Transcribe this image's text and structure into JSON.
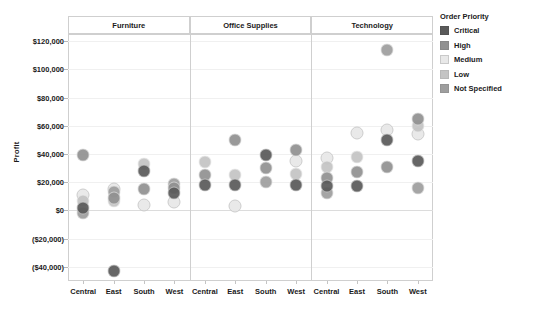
{
  "chart_data": {
    "type": "scatter",
    "title": "",
    "xlabel": "",
    "ylabel": "Profit",
    "ylim": [
      -50000,
      125000
    ],
    "grid": true,
    "legend_position": "right",
    "legend_title": "Order Priority",
    "panels": [
      "Furniture",
      "Office Supplies",
      "Technology"
    ],
    "regions": [
      "Central",
      "East",
      "South",
      "West"
    ],
    "y_ticks": [
      {
        "value": 120000,
        "label": "$120,000"
      },
      {
        "value": 100000,
        "label": "$100,000"
      },
      {
        "value": 80000,
        "label": "$80,000"
      },
      {
        "value": 60000,
        "label": "$60,000"
      },
      {
        "value": 40000,
        "label": "$40,000"
      },
      {
        "value": 20000,
        "label": "$20,000"
      },
      {
        "value": 0,
        "label": "$0"
      },
      {
        "value": -20000,
        "label": "($20,000)"
      },
      {
        "value": -40000,
        "label": "($40,000)"
      }
    ],
    "series": [
      {
        "name": "Critical",
        "color": "#5a5a5a"
      },
      {
        "name": "High",
        "color": "#919191"
      },
      {
        "name": "Medium",
        "color": "#e8e8e8"
      },
      {
        "name": "Low",
        "color": "#c4c4c4"
      },
      {
        "name": "Not Specified",
        "color": "#9e9e9e"
      }
    ],
    "points": [
      {
        "panel": "Furniture",
        "region": "Central",
        "priority": "High",
        "profit": 39000
      },
      {
        "panel": "Furniture",
        "region": "Central",
        "priority": "Medium",
        "profit": 11000
      },
      {
        "panel": "Furniture",
        "region": "Central",
        "priority": "Low",
        "profit": 7000
      },
      {
        "panel": "Furniture",
        "region": "Central",
        "priority": "Critical",
        "profit": 2000
      },
      {
        "panel": "Furniture",
        "region": "Central",
        "priority": "Not Specified",
        "profit": -2000
      },
      {
        "panel": "Furniture",
        "region": "East",
        "priority": "Medium",
        "profit": 15000
      },
      {
        "panel": "Furniture",
        "region": "East",
        "priority": "Not Specified",
        "profit": 13000
      },
      {
        "panel": "Furniture",
        "region": "East",
        "priority": "High",
        "profit": 9000
      },
      {
        "panel": "Furniture",
        "region": "East",
        "priority": "Low",
        "profit": 7000
      },
      {
        "panel": "Furniture",
        "region": "East",
        "priority": "Critical",
        "profit": -43000
      },
      {
        "panel": "Furniture",
        "region": "South",
        "priority": "Low",
        "profit": 33000
      },
      {
        "panel": "Furniture",
        "region": "South",
        "priority": "Critical",
        "profit": 28000
      },
      {
        "panel": "Furniture",
        "region": "South",
        "priority": "High",
        "profit": 15000
      },
      {
        "panel": "Furniture",
        "region": "South",
        "priority": "Medium",
        "profit": 4000
      },
      {
        "panel": "Furniture",
        "region": "West",
        "priority": "Not Specified",
        "profit": 19000
      },
      {
        "panel": "Furniture",
        "region": "West",
        "priority": "High",
        "profit": 16000
      },
      {
        "panel": "Furniture",
        "region": "West",
        "priority": "Critical",
        "profit": 12000
      },
      {
        "panel": "Furniture",
        "region": "West",
        "priority": "Medium",
        "profit": 6000
      },
      {
        "panel": "Office Supplies",
        "region": "Central",
        "priority": "Low",
        "profit": 34000
      },
      {
        "panel": "Office Supplies",
        "region": "Central",
        "priority": "High",
        "profit": 25000
      },
      {
        "panel": "Office Supplies",
        "region": "Central",
        "priority": "Critical",
        "profit": 18000
      },
      {
        "panel": "Office Supplies",
        "region": "East",
        "priority": "High",
        "profit": 50000
      },
      {
        "panel": "Office Supplies",
        "region": "East",
        "priority": "Low",
        "profit": 25000
      },
      {
        "panel": "Office Supplies",
        "region": "East",
        "priority": "Critical",
        "profit": 18000
      },
      {
        "panel": "Office Supplies",
        "region": "East",
        "priority": "Medium",
        "profit": 3000
      },
      {
        "panel": "Office Supplies",
        "region": "South",
        "priority": "Critical",
        "profit": 39000
      },
      {
        "panel": "Office Supplies",
        "region": "South",
        "priority": "High",
        "profit": 30000
      },
      {
        "panel": "Office Supplies",
        "region": "South",
        "priority": "Not Specified",
        "profit": 20000
      },
      {
        "panel": "Office Supplies",
        "region": "West",
        "priority": "High",
        "profit": 43000
      },
      {
        "panel": "Office Supplies",
        "region": "West",
        "priority": "Medium",
        "profit": 35000
      },
      {
        "panel": "Office Supplies",
        "region": "West",
        "priority": "Low",
        "profit": 26000
      },
      {
        "panel": "Office Supplies",
        "region": "West",
        "priority": "Critical",
        "profit": 18000
      },
      {
        "panel": "Technology",
        "region": "Central",
        "priority": "Medium",
        "profit": 37000
      },
      {
        "panel": "Technology",
        "region": "Central",
        "priority": "Low",
        "profit": 31000
      },
      {
        "panel": "Technology",
        "region": "Central",
        "priority": "High",
        "profit": 23000
      },
      {
        "panel": "Technology",
        "region": "Central",
        "priority": "Critical",
        "profit": 17000
      },
      {
        "panel": "Technology",
        "region": "Central",
        "priority": "Not Specified",
        "profit": 12000
      },
      {
        "panel": "Technology",
        "region": "East",
        "priority": "Medium",
        "profit": 55000
      },
      {
        "panel": "Technology",
        "region": "East",
        "priority": "Low",
        "profit": 38000
      },
      {
        "panel": "Technology",
        "region": "East",
        "priority": "High",
        "profit": 27000
      },
      {
        "panel": "Technology",
        "region": "East",
        "priority": "Critical",
        "profit": 17000
      },
      {
        "panel": "Technology",
        "region": "South",
        "priority": "Not Specified",
        "profit": 114000
      },
      {
        "panel": "Technology",
        "region": "South",
        "priority": "Medium",
        "profit": 57000
      },
      {
        "panel": "Technology",
        "region": "South",
        "priority": "Critical",
        "profit": 50000
      },
      {
        "panel": "Technology",
        "region": "South",
        "priority": "High",
        "profit": 31000
      },
      {
        "panel": "Technology",
        "region": "West",
        "priority": "High",
        "profit": 65000
      },
      {
        "panel": "Technology",
        "region": "West",
        "priority": "Low",
        "profit": 60000
      },
      {
        "panel": "Technology",
        "region": "West",
        "priority": "Medium",
        "profit": 54000
      },
      {
        "panel": "Technology",
        "region": "West",
        "priority": "Critical",
        "profit": 35000
      },
      {
        "panel": "Technology",
        "region": "West",
        "priority": "Not Specified",
        "profit": 16000
      }
    ]
  },
  "legend": {
    "title": "Order Priority",
    "items": [
      {
        "label": "Critical",
        "color": "#5a5a5a"
      },
      {
        "label": "High",
        "color": "#919191"
      },
      {
        "label": "Medium",
        "color": "#e8e8e8"
      },
      {
        "label": "Low",
        "color": "#c4c4c4"
      },
      {
        "label": "Not Specified",
        "color": "#9e9e9e"
      }
    ]
  },
  "axes": {
    "y_title": "Profit"
  }
}
